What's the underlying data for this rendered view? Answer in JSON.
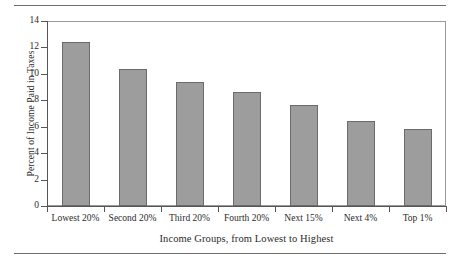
{
  "chart_data": {
    "type": "bar",
    "title": "",
    "categories": [
      "Lowest 20%",
      "Second 20%",
      "Third 20%",
      "Fourth 20%",
      "Next 15%",
      "Next 4%",
      "Top 1%"
    ],
    "values": [
      12.4,
      10.4,
      9.4,
      8.6,
      7.65,
      6.45,
      5.8
    ],
    "xlabel": "Income Groups, from Lowest to Highest",
    "ylabel": "Percent of Income Paid in Taxes",
    "ylim": [
      0,
      14
    ],
    "yticks": [
      "0",
      "2",
      "4",
      "6",
      "8",
      "10",
      "12",
      "14"
    ],
    "ytick_values": [
      0,
      2,
      4,
      6,
      8,
      10,
      12,
      14
    ],
    "grid": false,
    "legend": null,
    "bar_color": "#9d9d9d",
    "bar_edge_color": "#6b6b6b",
    "axis_color": "#555555",
    "rule_color": "#6e6e6e"
  }
}
